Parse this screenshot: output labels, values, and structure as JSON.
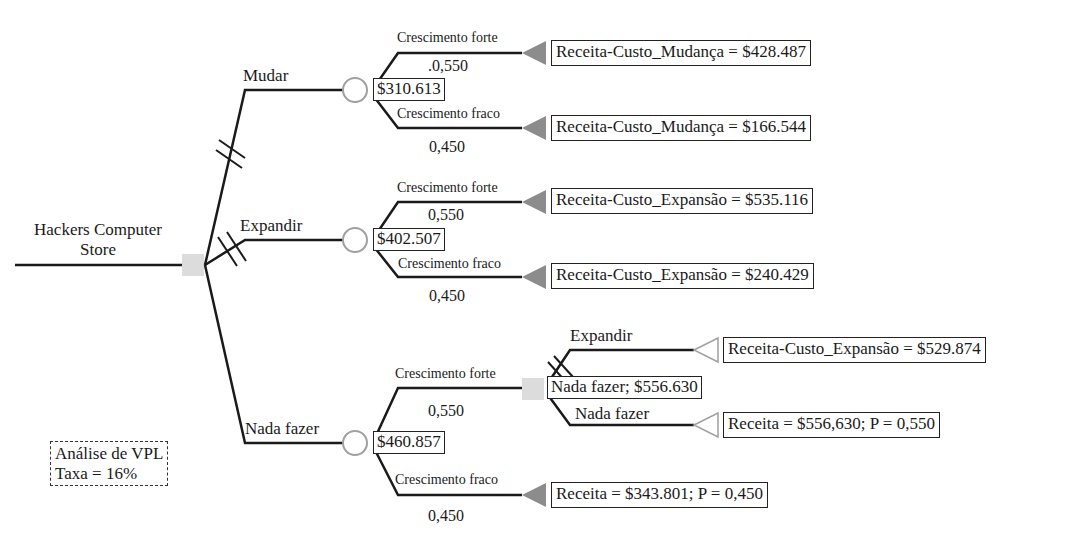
{
  "root": {
    "title_line1": "Hackers Computer",
    "title_line2": "Store"
  },
  "note": {
    "line1": "Análise de VPL",
    "line2": "Taxa = 16%"
  },
  "decisions": [
    {
      "label": "Mudar",
      "value": "$310.613",
      "outcomes": [
        {
          "label": "Crescimento forte",
          "prob": ".0,550",
          "payoff": "Receita-Custo_Mudança = $428.487"
        },
        {
          "label": "Crescimento fraco",
          "prob": "0,450",
          "payoff": "Receita-Custo_Mudança = $166.544"
        }
      ]
    },
    {
      "label": "Expandir",
      "value": "$402.507",
      "outcomes": [
        {
          "label": "Crescimento forte",
          "prob": "0,550",
          "payoff": "Receita-Custo_Expansão = $535.116"
        },
        {
          "label": "Crescimento fraco",
          "prob": "0,450",
          "payoff": "Receita-Custo_Expansão = $240.429"
        }
      ]
    },
    {
      "label": "Nada fazer",
      "value": "$460.857",
      "outcomes": [
        {
          "label": "Crescimento forte",
          "prob": "0,550",
          "sub_decision": {
            "value": "Nada fazer; $556.630",
            "options": [
              {
                "label": "Expandir",
                "payoff": "Receita-Custo_Expansão = $529.874"
              },
              {
                "label": "Nada fazer",
                "payoff": "Receita = $556,630; P = 0,550"
              }
            ]
          }
        },
        {
          "label": "Crescimento fraco",
          "prob": "0,450",
          "payoff": "Receita = $343.801; P = 0,450"
        }
      ]
    }
  ],
  "colors": {
    "line": "#1a1a1a",
    "decision_node": "#d9d9d9",
    "chance_node_stroke": "#9a9a9a",
    "terminal_fill": "#8c8c8c",
    "terminal_outline": "#9a9a9a"
  }
}
